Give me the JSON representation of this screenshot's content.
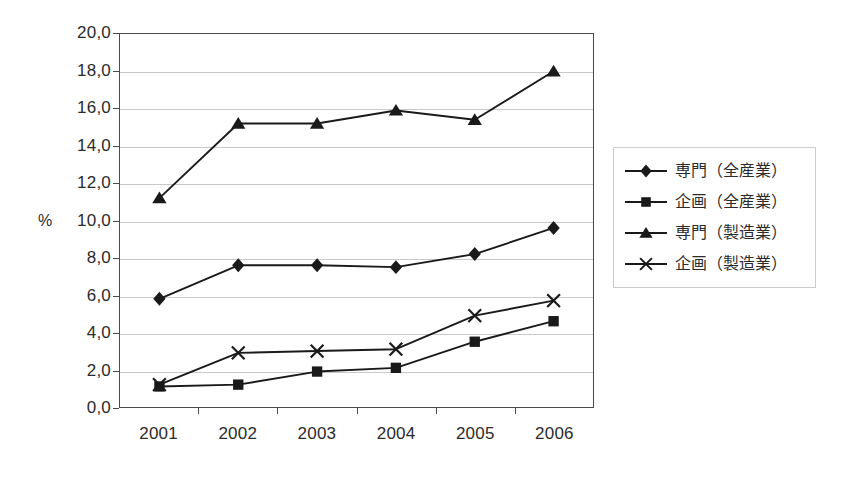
{
  "chart_data": {
    "type": "line",
    "title": "",
    "subtitle": "",
    "xlabel": "",
    "ylabel": "%",
    "categories": [
      "2001",
      "2002",
      "2003",
      "2004",
      "2005",
      "2006"
    ],
    "ylim": [
      0.0,
      20.0
    ],
    "ytick_step": 2.0,
    "ytick_labels": [
      "0,0",
      "2,0",
      "4,0",
      "6,0",
      "8,0",
      "10,0",
      "12,0",
      "14,0",
      "16,0",
      "18,0",
      "20,0"
    ],
    "ytick_values": [
      0.0,
      2.0,
      4.0,
      6.0,
      8.0,
      10.0,
      12.0,
      14.0,
      16.0,
      18.0,
      20.0
    ],
    "decimal_separator": ",",
    "grid": true,
    "legend_position": "right",
    "series": [
      {
        "name": "専門（全産業）",
        "marker": "diamond",
        "values": [
          5.8,
          7.6,
          7.6,
          7.5,
          8.2,
          9.6
        ]
      },
      {
        "name": "企画（全産業）",
        "marker": "square",
        "values": [
          1.1,
          1.2,
          1.9,
          2.1,
          3.5,
          4.6
        ]
      },
      {
        "name": "専門（製造業）",
        "marker": "triangle",
        "values": [
          11.2,
          15.2,
          15.2,
          15.9,
          15.4,
          18.0
        ]
      },
      {
        "name": "企画（製造業）",
        "marker": "cross",
        "values": [
          1.2,
          2.9,
          3.0,
          3.1,
          4.9,
          5.7
        ]
      }
    ],
    "colors": {
      "series_line": "#1a1a1a",
      "grid": "#c9c9c9",
      "axis": "#4a4a4a",
      "text": "#2b2b2b",
      "background": "#ffffff"
    }
  }
}
